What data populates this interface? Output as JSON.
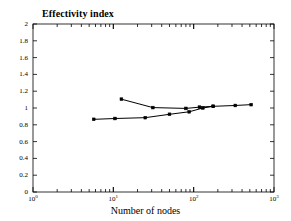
{
  "chart_data": {
    "type": "line",
    "title": "Effectivity index",
    "xlabel": "Number of nodes",
    "ylabel": "",
    "xscale": "log",
    "yscale": "linear",
    "xlim": [
      1,
      1000
    ],
    "ylim": [
      0,
      2
    ],
    "yticks": [
      0,
      0.2,
      0.4,
      0.6,
      0.8,
      1,
      1.2,
      1.4,
      1.6,
      1.8,
      2
    ],
    "ytick_labels": [
      "0",
      "0.2",
      "0.4",
      "0.6",
      "0.8",
      "1",
      "1.2",
      "1.4",
      "1.6",
      "1.8",
      "2"
    ],
    "xticks": [
      1,
      10,
      100,
      1000
    ],
    "xtick_labels": [
      "10",
      "10",
      "10",
      "10"
    ],
    "xtick_exponents": [
      "0",
      "1",
      "2",
      "3"
    ],
    "grid": false,
    "legend": null,
    "marker": "square",
    "line_color": "#000000",
    "series": [
      {
        "name": "lower-curve",
        "x": [
          5.7,
          10.5,
          25,
          50,
          88,
          130,
          175,
          330,
          520
        ],
        "y": [
          0.865,
          0.875,
          0.885,
          0.925,
          0.955,
          1.0,
          1.02,
          1.03,
          1.04
        ]
      },
      {
        "name": "upper-curve",
        "x": [
          12.6,
          31,
          80,
          118,
          175
        ],
        "y": [
          1.105,
          1.005,
          0.995,
          1.01,
          1.02
        ]
      }
    ]
  },
  "axes": {
    "title": "Effectivity index",
    "x_axis_title": "Number of nodes"
  }
}
